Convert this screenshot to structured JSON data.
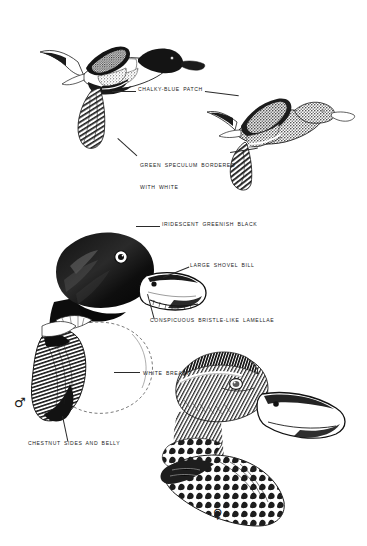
{
  "plate": {
    "background_color": "#ffffff",
    "ink_color": "#1b1b1b",
    "width": 367,
    "height": 546
  },
  "labels": [
    {
      "id": "chalky-blue-patch",
      "text": "CHALKY-BLUE PATCH",
      "x": 138,
      "y": 89,
      "lines": [
        "CHALKY-BLUE PATCH"
      ]
    },
    {
      "id": "green-speculum",
      "text": "GREEN SPECULUM BORDERED WITH WHITE",
      "x": 140,
      "y": 151,
      "lines": [
        "GREEN SPECULUM BORDERED",
        "WITH WHITE"
      ]
    },
    {
      "id": "iridescent-head",
      "text": "IRIDESCENT GREENISH BLACK",
      "x": 162,
      "y": 224,
      "lines": [
        "IRIDESCENT GREENISH BLACK"
      ]
    },
    {
      "id": "large-shovel-bill",
      "text": "LARGE SHOVEL BILL",
      "x": 190,
      "y": 265,
      "lines": [
        "LARGE SHOVEL BILL"
      ]
    },
    {
      "id": "bristle-lamellae",
      "text": "CONSPICUOUS BRISTLE-LIKE LAMELLAE",
      "x": 150,
      "y": 320,
      "lines": [
        "CONSPICUOUS BRISTLE-LIKE LAMELLAE"
      ]
    },
    {
      "id": "white-breast",
      "text": "WHITE BREAST",
      "x": 141,
      "y": 373,
      "lines": [
        "WHITE BREAST"
      ]
    },
    {
      "id": "chestnut-sides",
      "text": "CHESTNUT SIDES AND BELLY",
      "x": 28,
      "y": 443,
      "lines": [
        "CHESTNUT SIDES AND BELLY"
      ]
    }
  ],
  "symbols": {
    "male": {
      "glyph": "♂",
      "x": 14,
      "y": 402,
      "size": 13
    },
    "female": {
      "glyph": "♀",
      "x": 213,
      "y": 513,
      "size": 13
    }
  },
  "figures": [
    {
      "id": "male-in-flight",
      "name": "male northern shoveler in flight"
    },
    {
      "id": "female-in-flight",
      "name": "female northern shoveler in flight"
    },
    {
      "id": "male-head-breast",
      "name": "male head and breast study"
    },
    {
      "id": "female-head-body",
      "name": "female head and body study"
    }
  ]
}
